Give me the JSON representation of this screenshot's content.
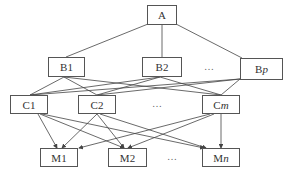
{
  "diagram": {
    "root": {
      "label": "A"
    },
    "level_b": [
      {
        "label": "B1"
      },
      {
        "label": "B2"
      },
      {
        "label": "B",
        "sub": "p"
      }
    ],
    "level_c": [
      {
        "label": "C1"
      },
      {
        "label": "C2"
      },
      {
        "label": "C",
        "sub": "m"
      }
    ],
    "level_m": [
      {
        "label": "M1"
      },
      {
        "label": "M2"
      },
      {
        "label": "M",
        "sub": "n"
      }
    ],
    "ellipsis": "…",
    "edges": {
      "A_to_B": [
        "A-B1",
        "A-B2",
        "A-Bp"
      ],
      "B_to_C": [
        "B1-C1",
        "B1-C2",
        "B1-Cm",
        "B2-C1",
        "B2-C2",
        "B2-Cm",
        "Bp-C1",
        "Bp-C2",
        "Bp-Cm"
      ],
      "C_to_M_arrows": [
        "C1-M1",
        "C1-M2",
        "C1-Mn",
        "C2-M1",
        "C2-M2",
        "C2-Mn",
        "Cm-M1",
        "Cm-M2",
        "Cm-Mn"
      ]
    },
    "colors": {
      "line": "#444444",
      "box_border": "#555555",
      "text": "#333333"
    }
  }
}
